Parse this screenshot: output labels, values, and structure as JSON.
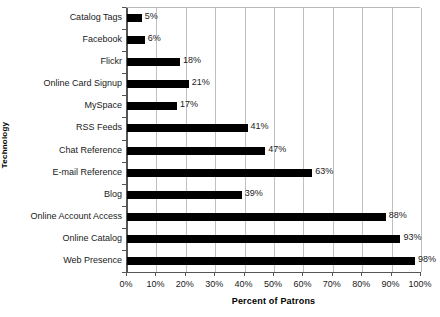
{
  "chart_data": {
    "type": "bar",
    "orientation": "horizontal",
    "title": "",
    "xlabel": "Percent of Patrons",
    "ylabel": "Technology",
    "xlim": [
      0,
      100
    ],
    "ylim": null,
    "grid": true,
    "legend": null,
    "xticks": [
      "0%",
      "10%",
      "20%",
      "30%",
      "40%",
      "50%",
      "60%",
      "70%",
      "80%",
      "90%",
      "100%"
    ],
    "xtick_values": [
      0,
      10,
      20,
      30,
      40,
      50,
      60,
      70,
      80,
      90,
      100
    ],
    "categories": [
      "Catalog Tags",
      "Facebook",
      "Flickr",
      "Online Card Signup",
      "MySpace",
      "RSS Feeds",
      "Chat Reference",
      "E-mail Reference",
      "Blog",
      "Online Account Access",
      "Online Catalog",
      "Web Presence"
    ],
    "values": [
      5,
      6,
      18,
      21,
      17,
      41,
      47,
      63,
      39,
      88,
      93,
      98
    ],
    "data_labels": [
      "5%",
      "6%",
      "18%",
      "21%",
      "17%",
      "41%",
      "47%",
      "63%",
      "39%",
      "88%",
      "93%",
      "98%"
    ],
    "series": [
      {
        "name": "Percent of Patrons",
        "values": [
          5,
          6,
          18,
          21,
          17,
          41,
          47,
          63,
          39,
          88,
          93,
          98
        ],
        "color": "#000000"
      }
    ],
    "bar_color": "#000000",
    "gridline_color": "#bfbfbf",
    "axis_color": "#555555",
    "background": "#ffffff"
  }
}
